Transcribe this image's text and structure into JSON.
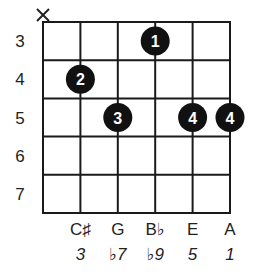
{
  "title": "",
  "grid": {
    "strings": 6,
    "x_start": 43,
    "x_end": 230,
    "frets_shown": [
      3,
      4,
      5,
      6,
      7
    ],
    "y_start": 22,
    "y_end": 213,
    "line_color": "#1a1a1a",
    "line_width": 2
  },
  "fret_labels": [
    "3",
    "4",
    "5",
    "6",
    "7"
  ],
  "muted_strings": [
    {
      "string": 1,
      "symbol": "X"
    }
  ],
  "fingers": [
    {
      "string": 4,
      "fret": 3,
      "label": "1"
    },
    {
      "string": 2,
      "fret": 4,
      "label": "2"
    },
    {
      "string": 3,
      "fret": 5,
      "label": "3"
    },
    {
      "string": 5,
      "fret": 5,
      "label": "4"
    },
    {
      "string": 6,
      "fret": 5,
      "label": "4"
    }
  ],
  "string_notes": [
    {
      "string": 2,
      "note": "C♯",
      "interval": "3"
    },
    {
      "string": 3,
      "note": "G",
      "interval": "♭7"
    },
    {
      "string": 4,
      "note": "B♭",
      "interval": "♭9"
    },
    {
      "string": 5,
      "note": "E",
      "interval": "5"
    },
    {
      "string": 6,
      "note": "A",
      "interval": "1"
    }
  ],
  "dot_color": "#111111",
  "dot_text_color": "#ffffff"
}
